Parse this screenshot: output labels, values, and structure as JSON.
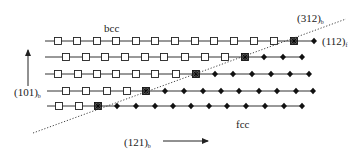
{
  "labels": {
    "bcc": "bcc",
    "fcc": "fcc",
    "vertical_axis": "(101)",
    "vertical_axis_sub": "b",
    "horizontal_axis": "(121)",
    "horizontal_axis_sub": "b",
    "interface_plane": "(312)",
    "interface_plane_sub": "b",
    "fcc_plane": "(112)",
    "fcc_plane_sub": "f"
  },
  "legend_semantics": {
    "open_square": "bcc atom",
    "filled_diamond": "fcc atom",
    "crossed_square": "interface atom"
  },
  "colors": {
    "line": "#333333",
    "marker_stroke": "#222222",
    "background": "#ffffff"
  },
  "rows": [
    {
      "y": 41,
      "x_start": 45,
      "x_end": 316,
      "bcc": [
        58,
        77,
        97,
        116,
        136,
        155,
        175,
        195,
        214,
        234,
        254,
        274
      ],
      "interface": [
        294
      ],
      "fcc": [
        314
      ]
    },
    {
      "y": 57,
      "x_start": 45,
      "x_end": 304,
      "bcc": [
        66,
        86,
        105,
        125,
        145,
        164,
        185,
        205,
        225
      ],
      "interface": [
        245
      ],
      "fcc": [
        264,
        283,
        302
      ]
    },
    {
      "y": 74,
      "x_start": 45,
      "x_end": 311,
      "bcc": [
        58,
        78,
        97,
        116,
        136,
        155,
        176
      ],
      "interface": [
        196
      ],
      "fcc": [
        215,
        233,
        252,
        271,
        290,
        309
      ]
    },
    {
      "y": 91,
      "x_start": 47,
      "x_end": 315,
      "bcc": [
        66,
        86,
        107,
        127
      ],
      "interface": [
        146
      ],
      "fcc": [
        165,
        184,
        203,
        221,
        239,
        259,
        277,
        296,
        313
      ]
    },
    {
      "y": 106,
      "x_start": 47,
      "x_end": 304,
      "bcc": [
        59,
        79
      ],
      "interface": [
        98
      ],
      "fcc": [
        117,
        136,
        155,
        173,
        191,
        209,
        227,
        246,
        265,
        284,
        302
      ]
    }
  ],
  "dotted_line": {
    "x1": 33,
    "y1": 133,
    "x2": 346,
    "y2": 19
  },
  "vertical_arrow": {
    "x": 28,
    "y_bottom": 86,
    "y_top": 50
  },
  "horizontal_arrow": {
    "y": 141,
    "x_start": 163,
    "x_end": 208
  }
}
